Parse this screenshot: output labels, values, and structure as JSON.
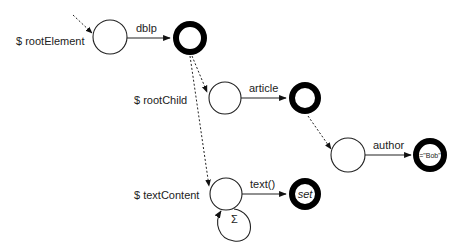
{
  "diagram": {
    "type": "automaton",
    "variables": [
      {
        "id": "rootElement",
        "label": "$ rootElement"
      },
      {
        "id": "rootChild",
        "label": "$ rootChild"
      },
      {
        "id": "textContent",
        "label": "$ textContent"
      }
    ],
    "edges": [
      {
        "from": "q1",
        "to": "q2",
        "label": "dblp",
        "style": "solid"
      },
      {
        "from": "q3",
        "to": "q4",
        "label": "article",
        "style": "solid"
      },
      {
        "from": "q5",
        "to": "q6",
        "label": "author",
        "style": "solid"
      },
      {
        "from": "q7",
        "to": "q8",
        "label": "text()",
        "style": "solid"
      },
      {
        "from": "q7",
        "to": "q7",
        "label": "Σ",
        "style": "self-loop"
      }
    ],
    "final_labels": {
      "bob": "=\"Bob\"",
      "set": "set"
    }
  }
}
